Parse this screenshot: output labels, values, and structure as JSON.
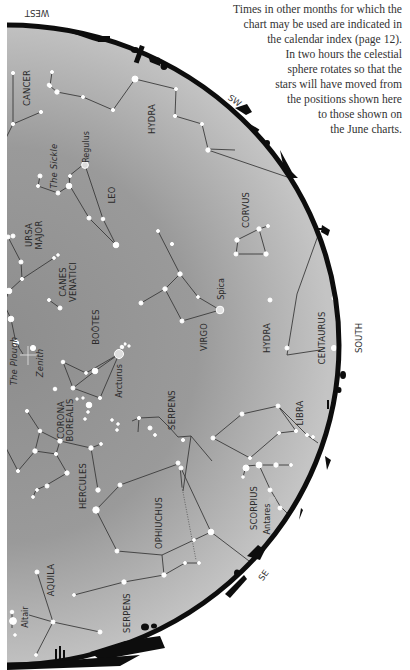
{
  "note": {
    "lines": [
      "Times in other months for which the",
      "chart may be used are indicated in",
      "the calendar index (page 12).",
      "In two hours the celestial",
      "sphere rotates so that the",
      "stars will have moved from",
      "the positions shown here",
      "to those shown on",
      "the June charts."
    ]
  },
  "directions": {
    "west": "WEST",
    "sw": "SW",
    "south": "SOUTH",
    "se": "SE"
  },
  "constellations": {
    "cancer": "CANCER",
    "hydra_upper": "HYDRA",
    "the_sickle": "The Sickle",
    "leo": "LEO",
    "corvus": "CORVUS",
    "ursa_major_1": "URSA",
    "ursa_major_2": "MAJOR",
    "canes_venatici_1": "CANES",
    "canes_venatici_2": "VENATICI",
    "virgo": "VIRGO",
    "hydra_lower": "HYDRA",
    "centaurus": "CENTAURUS",
    "bootes": "BOÖTES",
    "the_plough": "The Plough",
    "zenith": "Zenith",
    "corona_borealis_1": "CORONA",
    "corona_borealis_2": "BOREALIS",
    "serpens_upper": "SERPENS",
    "libra": "LIBRA",
    "hercules": "HERCULES",
    "ophiuchus": "OPHIUCHUS",
    "scorpius": "SCORPIUS",
    "aquila": "AQUILA",
    "serpens_lower": "SERPENS"
  },
  "stars": {
    "regulus": "Regulus",
    "spica": "Spica",
    "arcturus": "Arcturus",
    "antares": "Antares",
    "altair": "Altair"
  },
  "colors": {
    "sky_light": "#b9b9b9",
    "sky_dark": "#8e8e8e",
    "horizon": "#0d0d0d",
    "star": "#ffffff",
    "line": "#3a3a3a"
  }
}
